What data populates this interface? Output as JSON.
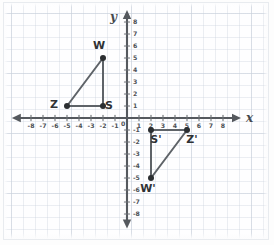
{
  "figure": {
    "background": "graph-paper",
    "line_color": "#5e6368",
    "point_color": "#2b2e31",
    "axis_color": "#55595e",
    "grid_color": "#c6ced9"
  },
  "axes": {
    "x_name": "x",
    "y_name": "y",
    "origin_label": "0",
    "x_ticks": [
      -8,
      -7,
      -6,
      -5,
      -4,
      -3,
      -2,
      -1,
      1,
      2,
      3,
      4,
      5,
      6,
      7,
      8
    ],
    "y_ticks": [
      8,
      7,
      6,
      5,
      4,
      3,
      2,
      1,
      -1,
      -2,
      -3,
      -4,
      -5,
      -6,
      -7,
      -8
    ],
    "x_tick_labels": [
      "-8",
      "-7",
      "-6",
      "-5",
      "-4",
      "-3",
      "-2",
      "-1",
      "1",
      "2",
      "3",
      "4",
      "5",
      "6",
      "7",
      "8"
    ],
    "y_tick_labels": [
      "8",
      "7",
      "6",
      "5",
      "4",
      "3",
      "2",
      "1",
      "-1",
      "-2",
      "-3",
      "-4",
      "-5",
      "-6",
      "-7",
      "-8"
    ],
    "xlim": [
      -9,
      9
    ],
    "ylim": [
      -9,
      9
    ]
  },
  "chart_data": {
    "type": "scatter",
    "xlabel": "x",
    "ylabel": "y",
    "xlim": [
      -9,
      9
    ],
    "ylim": [
      -9,
      9
    ],
    "grid": true,
    "legend": "none",
    "series": [
      {
        "name": "Triangle WZS",
        "closed": true,
        "points": [
          {
            "label": "W",
            "x": -2,
            "y": 5,
            "label_dx": -4,
            "label_dy": -9
          },
          {
            "label": "Z",
            "x": -5,
            "y": 1,
            "label_dx": -13,
            "label_dy": 2
          },
          {
            "label": "S",
            "x": -2,
            "y": 1,
            "label_dx": 6,
            "label_dy": 3
          }
        ]
      },
      {
        "name": "Triangle W'S'Z'",
        "closed": true,
        "points": [
          {
            "label": "S'",
            "x": 2,
            "y": -1,
            "label_dx": 5,
            "label_dy": 13
          },
          {
            "label": "Z'",
            "x": 5,
            "y": -1,
            "label_dx": 5,
            "label_dy": 13
          },
          {
            "label": "W'",
            "x": 2,
            "y": -5,
            "label_dx": -3,
            "label_dy": 14
          }
        ]
      }
    ]
  },
  "labels": {
    "w": "W",
    "z": "Z",
    "s": "S",
    "w_prime": "W'",
    "s_prime": "S'",
    "z_prime": "Z'",
    "x_axis": "x",
    "y_axis": "y",
    "origin": "0"
  }
}
